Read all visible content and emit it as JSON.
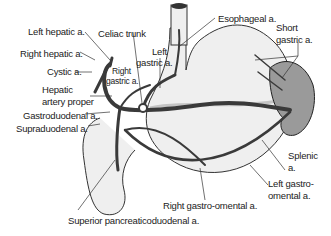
{
  "diagram": {
    "colors": {
      "stomach_fill": "#efefef",
      "spleen_fill": "#9a9a9a",
      "artery": "#3a3a3a",
      "vein_shadow": "#c4c4c4",
      "outline": "#333333",
      "label_text": "#222222"
    },
    "labels": {
      "left_hepatic": "Left hepatic a.",
      "celiac_trunk": "Celiac trunk",
      "left_gastric_1": "Left",
      "left_gastric_2": "gastric a.",
      "esophageal": "Esophageal a.",
      "short_gastric_1": "Short",
      "short_gastric_2": "gastric a.",
      "right_hepatic": "Right hepatic a.",
      "cystic": "Cystic a.",
      "right_gastric_1": "Right",
      "right_gastric_2": "gastric a.",
      "hepatic_proper_1": "Hepatic",
      "hepatic_proper_2": "artery proper",
      "gastroduodenal": "Gastroduodenal a.",
      "supraduodenal": "Supraduodenal a.",
      "splenic_1": "Splenic",
      "splenic_2": "a.",
      "left_gastroomental_1": "Left gastro-",
      "left_gastroomental_2": "omental a.",
      "right_gastroomental": "Right gastro-omental a.",
      "superior_pancreaticoduodenal": "Superior pancreaticoduodenal a."
    }
  }
}
